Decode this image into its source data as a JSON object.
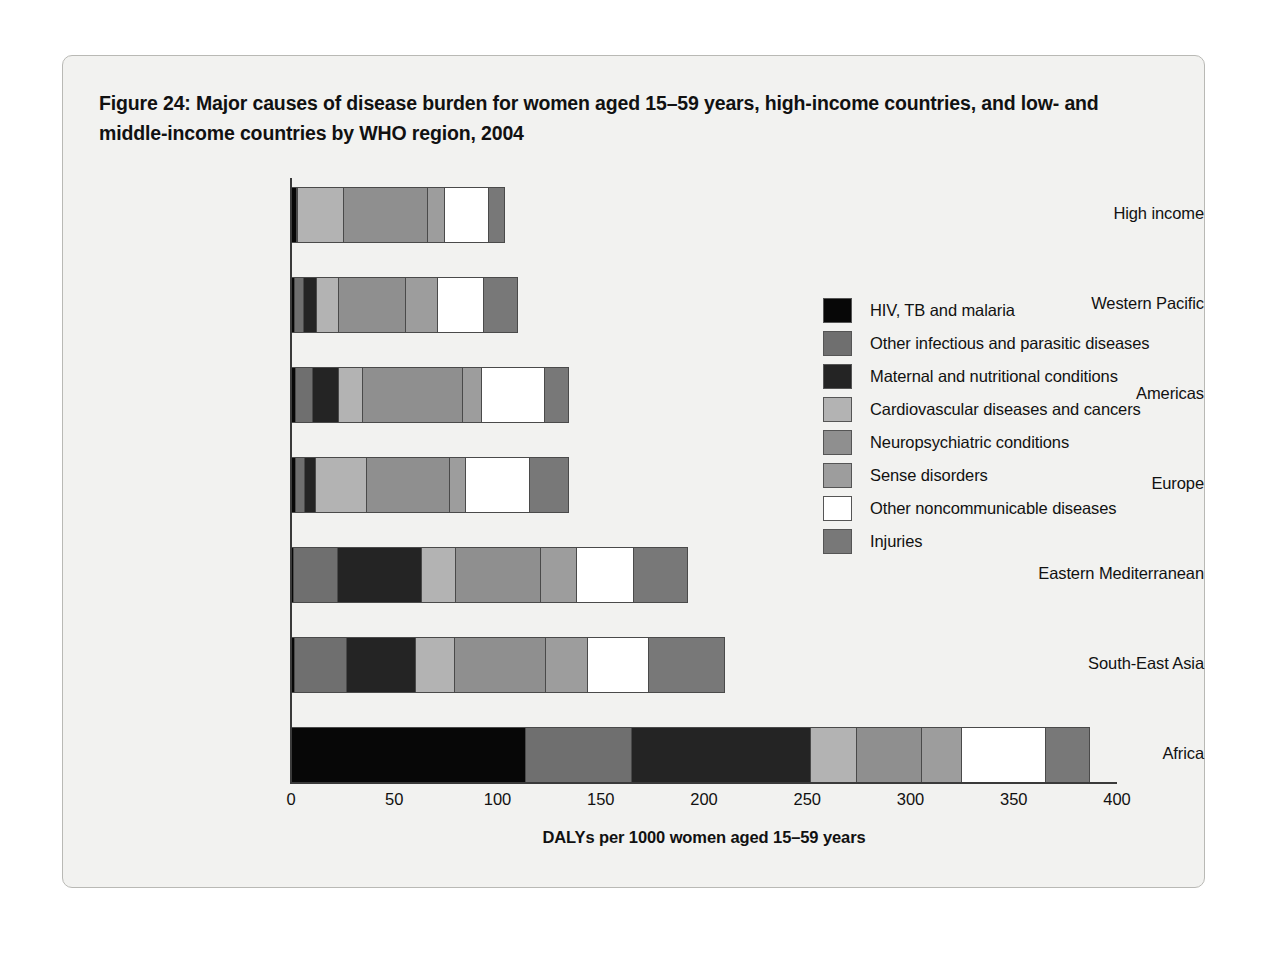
{
  "figure": {
    "title": "Figure 24: Major causes of disease burden for women aged 15–59 years, high-income countries, and low- and middle-income countries by WHO region, 2004"
  },
  "chart_data": {
    "type": "bar",
    "orientation": "horizontal",
    "stacked": true,
    "title": "Figure 24: Major causes of disease burden for women aged 15–59 years, high-income countries, and low- and middle-income countries by WHO region, 2004",
    "xlabel": "DALYs per 1000 women aged 15–59 years",
    "ylabel": "",
    "xlim": [
      0,
      400
    ],
    "xticks": [
      0,
      50,
      100,
      150,
      200,
      250,
      300,
      350,
      400
    ],
    "xtick_labels": [
      "0",
      "50",
      "100",
      "150",
      "200",
      "250",
      "300",
      "350",
      "400"
    ],
    "grid": false,
    "legend_position": "right",
    "categories": [
      "High income",
      "Western Pacific",
      "Americas",
      "Europe",
      "Eastern Mediterranean",
      "South-East Asia",
      "Africa"
    ],
    "series": [
      {
        "name": "HIV, TB and malaria",
        "color": "#070707",
        "values": [
          3,
          2,
          2.5,
          2.5,
          1.5,
          2,
          114
        ]
      },
      {
        "name": "Other infectious and parasitic diseases",
        "color": "#6f6f6f",
        "values": [
          0,
          5,
          9,
          5,
          22,
          26,
          52
        ]
      },
      {
        "name": "Maternal and nutritional conditions",
        "color": "#242424",
        "values": [
          0.5,
          7,
          13,
          6,
          41,
          34,
          87
        ]
      },
      {
        "name": "Cardiovascular diseases and cancers",
        "color": "#b3b3b3",
        "values": [
          23,
          11,
          12,
          25,
          17,
          19,
          23
        ]
      },
      {
        "name": "Neuropsychiatric conditions",
        "color": "#8f8f8f",
        "values": [
          41,
          33,
          49,
          41,
          42,
          45,
          32
        ]
      },
      {
        "name": "Sense disorders",
        "color": "#9d9d9d",
        "values": [
          9,
          16,
          10,
          8,
          18,
          21,
          20
        ]
      },
      {
        "name": "Other noncommunicable diseases",
        "color": "#ffffff",
        "values": [
          22,
          23,
          31,
          32,
          28,
          30,
          41
        ]
      },
      {
        "name": "Injuries",
        "color": "#787878",
        "values": [
          8,
          17,
          12,
          19,
          27,
          37,
          22
        ]
      }
    ],
    "totals": [
      106.5,
      114,
      138.5,
      138.5,
      196.5,
      214,
      391
    ]
  },
  "legend": {
    "items": [
      {
        "label": "HIV, TB and malaria",
        "color": "#070707"
      },
      {
        "label": "Other infectious and parasitic diseases",
        "color": "#6f6f6f"
      },
      {
        "label": "Maternal and nutritional conditions",
        "color": "#242424"
      },
      {
        "label": "Cardiovascular diseases and cancers",
        "color": "#b3b3b3"
      },
      {
        "label": "Neuropsychiatric conditions",
        "color": "#8f8f8f"
      },
      {
        "label": "Sense disorders",
        "color": "#9d9d9d"
      },
      {
        "label": "Other noncommunicable diseases",
        "color": "#ffffff"
      },
      {
        "label": "Injuries",
        "color": "#787878"
      }
    ]
  }
}
